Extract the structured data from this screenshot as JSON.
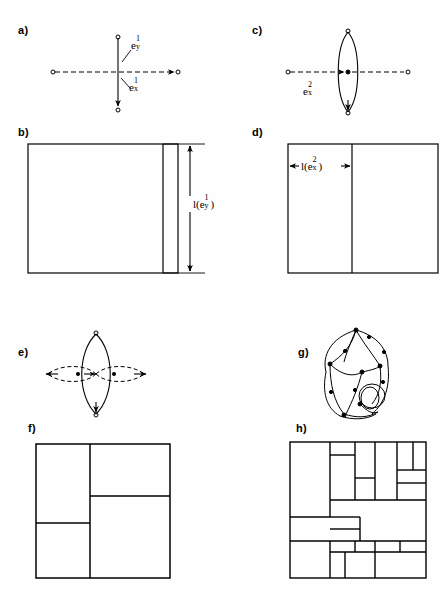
{
  "figure": {
    "width": 441,
    "height": 593,
    "background": "#fefefe",
    "ink": "#000000"
  },
  "panels": [
    {
      "id": "a",
      "label": "a)",
      "label_x": 18,
      "label_y": 30,
      "type": "graph-cross",
      "description": "Two-edge cross graph: solid vertical edge e_y^1 with arrow pointing down, dashed horizontal edge e_x^1 pointing right",
      "center": [
        118,
        72
      ],
      "vertical": {
        "x": 118,
        "y_top": 38,
        "y_bottom": 110,
        "style": "solid",
        "arrow": "down"
      },
      "horizontal": {
        "y": 72,
        "x_left": 52,
        "x_right": 178,
        "style": "dashed",
        "arrow": "right"
      },
      "labels": [
        {
          "text": "e",
          "sup": "1",
          "sub": "y",
          "x": 133,
          "y": 44,
          "leader_to": [
            122,
            62
          ]
        },
        {
          "text": "e",
          "sup": "1",
          "sub": "x",
          "x": 131,
          "y": 85,
          "leader_to": [
            121,
            79
          ]
        }
      ]
    },
    {
      "id": "b",
      "label": "b)",
      "label_x": 18,
      "label_y": 132,
      "type": "dissection",
      "description": "Square with one vertical cut near the right edge; dimension arrow marks full height l(e_y^1)",
      "rect": {
        "x": 28,
        "y": 144,
        "w": 150,
        "h": 129
      },
      "cuts": [
        {
          "orient": "vertical",
          "x": 163,
          "y1": 144,
          "y2": 273
        }
      ],
      "dimension": {
        "orient": "vertical",
        "x": 190,
        "y1": 144,
        "y2": 273,
        "tick_x1": 163,
        "tick_x2": 205,
        "label_text": "l(e",
        "label_sup": "1",
        "label_sub": "y",
        "label_close": ")",
        "label_x": 196,
        "label_y": 202
      }
    },
    {
      "id": "c",
      "label": "c)",
      "label_x": 252,
      "label_y": 30,
      "type": "graph-lens",
      "description": "Vertical bigon (two curved edges) with a dashed horizontal edge passing through; label e_x^2",
      "center": [
        348,
        72
      ],
      "lens": {
        "cx": 348,
        "cy": 72,
        "rx": 13,
        "ry": 42,
        "style": "solid",
        "arrow": "down"
      },
      "horizontal": {
        "y": 72,
        "x_left": 288,
        "x_right": 408,
        "style": "dashed",
        "arrow": "right"
      },
      "labels": [
        {
          "text": "e",
          "sup": "2",
          "sub": "x",
          "x": 306,
          "y": 88
        }
      ]
    },
    {
      "id": "d",
      "label": "d)",
      "label_x": 252,
      "label_y": 132,
      "type": "dissection",
      "description": "Square split by one vertical cut; horizontal dimension arrow marks the left strip width l(e_x^2)",
      "rect": {
        "x": 288,
        "y": 144,
        "w": 150,
        "h": 129
      },
      "cuts": [
        {
          "orient": "vertical",
          "x": 352,
          "y1": 144,
          "y2": 273
        }
      ],
      "dimension": {
        "orient": "horizontal",
        "y": 166,
        "x1": 288,
        "x2": 352,
        "label_text": "l(e",
        "label_sup": "2",
        "label_sub": "x",
        "label_close": ")",
        "label_x": 300,
        "label_y": 160
      }
    },
    {
      "id": "e",
      "label": "e)",
      "label_x": 18,
      "label_y": 352,
      "type": "graph-lens-cross",
      "description": "Vertical solid bigon crossed by two dashed horizontal lens lobes, all meeting at the centre",
      "center": [
        96,
        374
      ],
      "vertical_lens": {
        "cx": 96,
        "cy": 374,
        "rx": 18,
        "ry": 40,
        "style": "solid",
        "arrow": "down"
      },
      "horizontal_lenses": [
        {
          "cx": 72,
          "cy": 374,
          "rx": 26,
          "ry": 11,
          "style": "dashed",
          "arrow": "left"
        },
        {
          "cx": 120,
          "cy": 374,
          "rx": 26,
          "ry": 11,
          "style": "dashed",
          "arrow": "right"
        }
      ]
    },
    {
      "id": "f",
      "label": "f)",
      "label_x": 28,
      "label_y": 428,
      "type": "dissection",
      "description": "Pinwheel dissection of a square into four rectangles",
      "rect": {
        "x": 36,
        "y": 444,
        "w": 134,
        "h": 134
      },
      "cuts": [
        {
          "orient": "vertical",
          "x": 90,
          "y1": 444,
          "y2": 578
        },
        {
          "orient": "horizontal",
          "y": 523,
          "x1": 36,
          "x2": 90
        },
        {
          "orient": "horizontal",
          "y": 496,
          "x1": 90,
          "x2": 170
        }
      ]
    },
    {
      "id": "g",
      "label": "g)",
      "label_x": 298,
      "label_y": 352,
      "type": "graph-planar",
      "description": "Complex planar multigraph with many directed edges, two apex vertices and a small double-loop near the lower right",
      "center": [
        358,
        372
      ]
    },
    {
      "id": "h",
      "label": "h)",
      "label_x": 296,
      "label_y": 428,
      "type": "dissection",
      "description": "Squared-square style dissection of a square into about twenty-five rectangles",
      "rect": {
        "x": 290,
        "y": 442,
        "w": 136,
        "h": 136
      },
      "cuts": [
        {
          "orient": "vertical",
          "x": 330,
          "y1": 442,
          "y2": 517
        },
        {
          "orient": "vertical",
          "x": 330,
          "y1": 541,
          "y2": 578
        },
        {
          "orient": "horizontal",
          "y": 455,
          "x1": 330,
          "x2": 355
        },
        {
          "orient": "vertical",
          "x": 355,
          "y1": 442,
          "y2": 500
        },
        {
          "orient": "horizontal",
          "y": 478,
          "x1": 355,
          "x2": 375
        },
        {
          "orient": "vertical",
          "x": 375,
          "y1": 442,
          "y2": 500
        },
        {
          "orient": "horizontal",
          "y": 500,
          "x1": 330,
          "x2": 426
        },
        {
          "orient": "vertical",
          "x": 397,
          "y1": 442,
          "y2": 500
        },
        {
          "orient": "horizontal",
          "y": 470,
          "x1": 397,
          "x2": 426
        },
        {
          "orient": "horizontal",
          "y": 483,
          "x1": 397,
          "x2": 426
        },
        {
          "orient": "vertical",
          "x": 413,
          "y1": 442,
          "y2": 470
        },
        {
          "orient": "horizontal",
          "y": 517,
          "x1": 290,
          "x2": 330
        },
        {
          "orient": "horizontal",
          "y": 541,
          "x1": 290,
          "x2": 330
        },
        {
          "orient": "horizontal",
          "y": 552,
          "x1": 330,
          "x2": 426
        },
        {
          "orient": "horizontal",
          "y": 541,
          "x1": 330,
          "x2": 426
        },
        {
          "orient": "vertical",
          "x": 355,
          "y1": 541,
          "y2": 552
        },
        {
          "orient": "vertical",
          "x": 375,
          "y1": 541,
          "y2": 552
        },
        {
          "orient": "vertical",
          "x": 400,
          "y1": 541,
          "y2": 552
        },
        {
          "orient": "vertical",
          "x": 345,
          "y1": 552,
          "y2": 578
        },
        {
          "orient": "vertical",
          "x": 375,
          "y1": 552,
          "y2": 578
        },
        {
          "orient": "horizontal",
          "y": 529,
          "x1": 330,
          "x2": 360
        },
        {
          "orient": "vertical",
          "x": 360,
          "y1": 517,
          "y2": 541
        }
      ]
    }
  ]
}
